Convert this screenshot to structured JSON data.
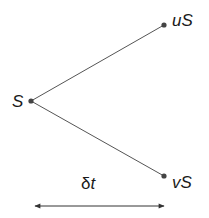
{
  "diagram": {
    "type": "binomial-tree",
    "colors": {
      "line": "#555555",
      "node": "#444444",
      "text": "#1a1a1a",
      "background": "#ffffff"
    },
    "nodes": {
      "root": {
        "label": "S"
      },
      "up": {
        "label": "uS"
      },
      "down": {
        "label": "vS"
      }
    },
    "time_step": {
      "label_prefix": "δ",
      "label_var": "t"
    }
  }
}
